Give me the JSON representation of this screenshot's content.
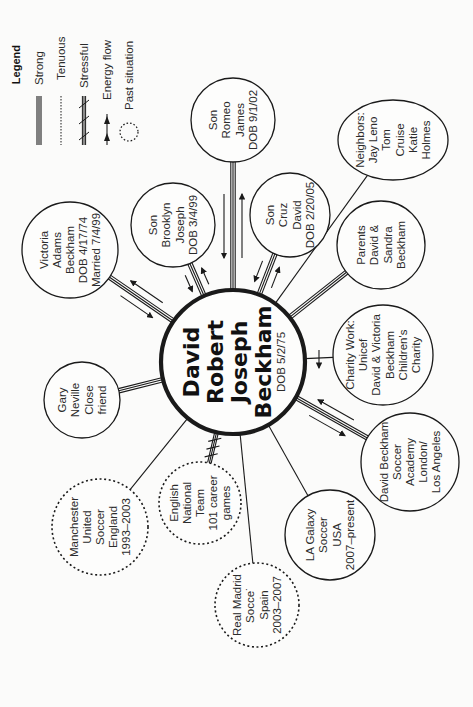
{
  "diagram": {
    "type": "ecomap",
    "orientation": "rotated-90-ccw",
    "center": {
      "id": "david",
      "lines": [
        "David",
        "Robert",
        "Joseph",
        "Beckham"
      ],
      "sub": "DOB 5/2/75",
      "cx": 233,
      "cy": 362,
      "r": 72
    },
    "nodes": [
      {
        "id": "romeo",
        "lines": [
          "Son",
          "Romeo",
          "James",
          "DOB 9/1/02"
        ],
        "cx": 233,
        "cy": 120,
        "rx": 42,
        "ry": 42,
        "past": false,
        "link": "strong",
        "energy": "both"
      },
      {
        "id": "brooklyn",
        "lines": [
          "Son",
          "Brooklyn",
          "Joseph",
          "DOB 3/4/99"
        ],
        "cx": 173,
        "cy": 225,
        "rx": 42,
        "ry": 42,
        "past": false,
        "link": "strong",
        "energy": "both"
      },
      {
        "id": "cruz",
        "lines": [
          "Son",
          "Cruz",
          "David",
          "DOB 2/20/05"
        ],
        "cx": 290,
        "cy": 215,
        "rx": 40,
        "ry": 42,
        "past": false,
        "link": "strong",
        "energy": "both"
      },
      {
        "id": "victoria",
        "lines": [
          "Victoria",
          "Adams",
          "Beckham",
          "DOB 4/17/74",
          "Married 7/4/99"
        ],
        "cx": 70,
        "cy": 250,
        "rx": 48,
        "ry": 48,
        "past": false,
        "link": "strong",
        "energy": "both"
      },
      {
        "id": "neighbors",
        "lines": [
          "Neighbors:",
          "Jay Leno",
          "Tom",
          "Cruise",
          "Katie",
          "Holmes"
        ],
        "cx": 393,
        "cy": 140,
        "rx": 55,
        "ry": 40,
        "past": false,
        "link": "tenuous",
        "energy": "none"
      },
      {
        "id": "parents",
        "lines": [
          "Parents",
          "David &",
          "Sandra",
          "Beckham"
        ],
        "cx": 381,
        "cy": 245,
        "rx": 44,
        "ry": 44,
        "past": false,
        "link": "strong",
        "energy": "none"
      },
      {
        "id": "charity",
        "lines": [
          "Charity Work:",
          "Unicef",
          "David & Victoria",
          "Beckham",
          "Children's",
          "Charity"
        ],
        "cx": 383,
        "cy": 355,
        "rx": 50,
        "ry": 50,
        "past": false,
        "link": "tenuous",
        "energy": "out"
      },
      {
        "id": "academy",
        "lines": [
          "David Beckham",
          "Soccer",
          "Academy",
          "London/",
          "Los Angeles"
        ],
        "cx": 410,
        "cy": 462,
        "rx": 49,
        "ry": 49,
        "past": false,
        "link": "strong",
        "energy": "both"
      },
      {
        "id": "lagalaxy",
        "lines": [
          "LA Galaxy",
          "Soccer",
          "USA",
          "2007–present"
        ],
        "cx": 330,
        "cy": 535,
        "rx": 45,
        "ry": 45,
        "past": false,
        "link": "tenuous",
        "energy": "none"
      },
      {
        "id": "realmadrid",
        "lines": [
          "Real Madrid",
          "Socce˙",
          "Spain",
          "2003–2007"
        ],
        "cx": 257,
        "cy": 605,
        "rx": 42,
        "ry": 42,
        "past": true,
        "link": "tenuous",
        "energy": "none"
      },
      {
        "id": "english",
        "lines": [
          "English",
          "National",
          "Team",
          "101 career",
          "games"
        ],
        "cx": 200,
        "cy": 503,
        "rx": 41,
        "ry": 41,
        "past": true,
        "link": "stressful",
        "energy": "none"
      },
      {
        "id": "manchester",
        "lines": [
          "Manchester",
          "United",
          "Soccer",
          "England",
          "1993–2003"
        ],
        "cx": 100,
        "cy": 527,
        "rx": 48,
        "ry": 48,
        "past": true,
        "link": "tenuous",
        "energy": "none"
      },
      {
        "id": "gary",
        "lines": [
          "Gary",
          "Neville",
          "Close",
          "friend"
        ],
        "cx": 82,
        "cy": 400,
        "rx": 38,
        "ry": 38,
        "past": false,
        "link": "strong",
        "energy": "none"
      }
    ],
    "legend": {
      "title": "Legend",
      "items": [
        {
          "id": "strong",
          "label": "Strong"
        },
        {
          "id": "tenuous",
          "label": "Tenuous"
        },
        {
          "id": "stressful",
          "label": "Stressful"
        },
        {
          "id": "energy",
          "label": "Energy flow"
        },
        {
          "id": "past",
          "label": "Past situation"
        }
      ]
    },
    "colors": {
      "ink": "#1a1a1a",
      "text": "#2b2b2b",
      "background": "#fbfbfa"
    }
  }
}
